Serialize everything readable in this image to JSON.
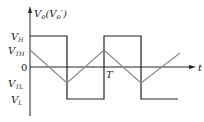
{
  "diagram": {
    "y_axis_label": "V",
    "y_axis_label_sub": "o",
    "y_axis_label_paren": "(V",
    "y_axis_label_paren_sub": "o",
    "y_axis_label_prime": "′)",
    "x_axis_label": "t",
    "period_label": "T",
    "levels": [
      {
        "name": "V_H",
        "main": "V",
        "sub": "H"
      },
      {
        "name": "V_TH",
        "main": "V",
        "sub": "TH"
      },
      {
        "name": "zero",
        "main": "0",
        "sub": ""
      },
      {
        "name": "V_TL",
        "main": "V",
        "sub": "TL"
      },
      {
        "name": "V_L",
        "main": "V",
        "sub": "L"
      }
    ],
    "colors": {
      "square_wave": "#222222",
      "triangle_wave": "#8a8a8a",
      "axes": "#222222"
    }
  }
}
